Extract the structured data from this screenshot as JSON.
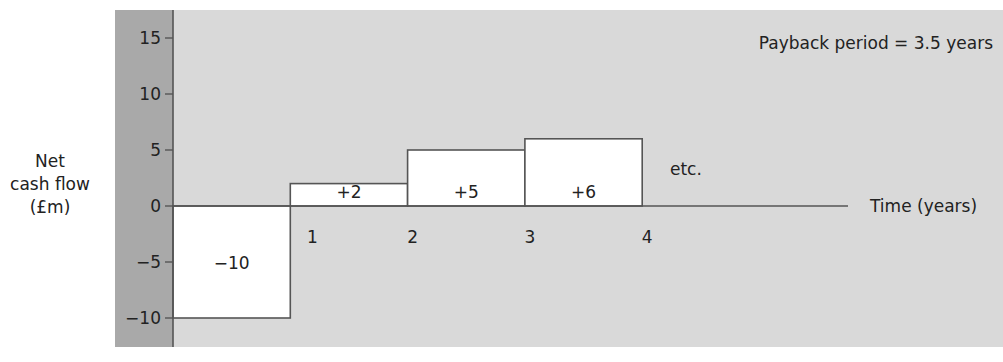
{
  "chart_data": {
    "type": "bar",
    "title": "",
    "annotation": "Payback period = 3.5 years",
    "xlabel": "Time (years)",
    "ylabel_lines": [
      "Net",
      "cash flow",
      "(£m)"
    ],
    "ylabel": "Net cash flow (£m)",
    "ylim": [
      -10,
      15
    ],
    "yticks": [
      15,
      10,
      5,
      0,
      -5,
      -10
    ],
    "ytick_labels": [
      "15",
      "10",
      "5",
      "0",
      "−5",
      "−10"
    ],
    "xticks": [
      1,
      2,
      3,
      4
    ],
    "xtick_labels": [
      "1",
      "2",
      "3",
      "4"
    ],
    "categories": [
      "Year 0–1",
      "Year 1–2",
      "Year 2–3",
      "Year 3–4"
    ],
    "values": [
      -10,
      2,
      5,
      6
    ],
    "bar_labels": [
      "−10",
      "+2",
      "+5",
      "+6"
    ],
    "trailing_note": "etc.",
    "grid": false,
    "legend": null
  },
  "colors": {
    "background": "#d9d9d9",
    "axis_strip": "#a9a9a9",
    "bar_fill": "#ffffff",
    "line": "#555555",
    "text": "#222222"
  },
  "layout": {
    "plot": {
      "x0": 115,
      "y0": 10,
      "x1": 1003,
      "y1": 347
    },
    "strip": {
      "x0": 115,
      "x1": 173
    },
    "origin_x": 173,
    "zero_y": 206,
    "px_per_unit_y": 11.2,
    "px_per_year": 117.3,
    "axis_end_x": 848
  }
}
